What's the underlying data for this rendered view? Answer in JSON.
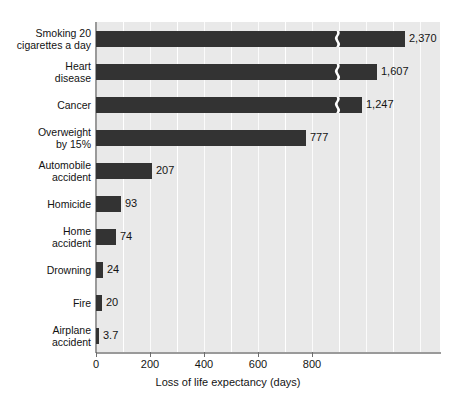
{
  "chart_data": {
    "type": "bar",
    "orientation": "horizontal",
    "title": "",
    "xlabel": "Loss of life expectancy (days)",
    "ylabel": "",
    "xlim": [
      0,
      1274
    ],
    "xticks": [
      0,
      200,
      400,
      600,
      800
    ],
    "xtick_labels": [
      "0",
      "200",
      "400",
      "600",
      "800"
    ],
    "minor_gridline_step": 100,
    "grid": true,
    "legend": null,
    "axis_break": true,
    "axis_break_note": "Bars for the top three categories are drawn with a break symbol; their plotted length is compressed.",
    "categories": [
      "Smoking 20\ncigarettes a day",
      "Heart\ndisease",
      "Cancer",
      "Overweight\nby 15%",
      "Automobile\naccident",
      "Homicide",
      "Home\naccident",
      "Drowning",
      "Fire",
      "Airplane\naccident"
    ],
    "values": [
      2370,
      1607,
      1247,
      777,
      207,
      93,
      74,
      24,
      20,
      3.7
    ],
    "value_labels": [
      "2,370",
      "1,607",
      "1,247",
      "777",
      "207",
      "93",
      "74",
      "24",
      "20",
      "3.7"
    ],
    "bars": [
      {
        "label": "Smoking 20\ncigarettes a day",
        "value": 2370,
        "value_label": "2,370",
        "broken": true,
        "px_end": 405,
        "break_px": 333
      },
      {
        "label": "Heart\ndisease",
        "value": 1607,
        "value_label": "1,607",
        "broken": true,
        "px_end": 377,
        "break_px": 333
      },
      {
        "label": "Cancer",
        "value": 1247,
        "value_label": "1,247",
        "broken": true,
        "px_end": 362,
        "break_px": 333
      },
      {
        "label": "Overweight\nby 15%",
        "value": 777,
        "value_label": "777",
        "broken": false,
        "px_end": 306,
        "break_px": 0
      },
      {
        "label": "Automobile\naccident",
        "value": 207,
        "value_label": "207",
        "broken": false,
        "px_end": 152,
        "break_px": 0
      },
      {
        "label": "Homicide",
        "value": 93,
        "value_label": "93",
        "broken": false,
        "px_end": 121,
        "break_px": 0
      },
      {
        "label": "Home\naccident",
        "value": 74,
        "value_label": "74",
        "broken": false,
        "px_end": 116,
        "break_px": 0
      },
      {
        "label": "Drowning",
        "value": 24,
        "value_label": "24",
        "broken": false,
        "px_end": 103,
        "break_px": 0
      },
      {
        "label": "Fire",
        "value": 20,
        "value_label": "20",
        "broken": false,
        "px_end": 102,
        "break_px": 0
      },
      {
        "label": "Airplane\naccident",
        "value": 3.7,
        "value_label": "3.7",
        "broken": false,
        "px_end": 99,
        "break_px": 0
      }
    ],
    "colors": {
      "bar": "#333333",
      "plot_background": "#e9e9e9",
      "gridline": "#ffffff",
      "axis": "#9a9a9a",
      "text": "#141414",
      "page_background": "#ffffff"
    }
  }
}
